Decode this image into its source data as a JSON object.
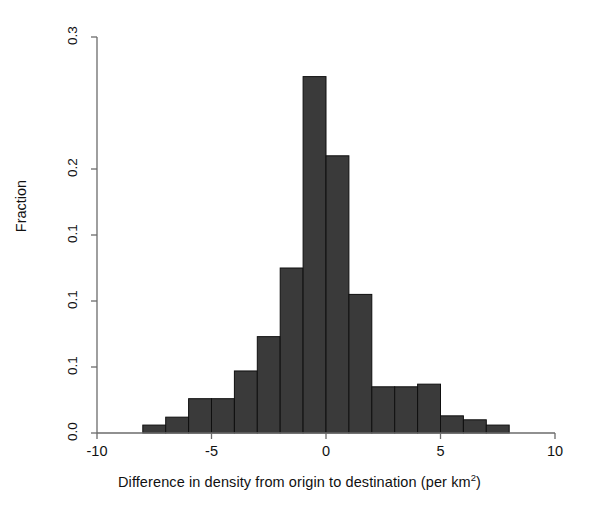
{
  "chart_data": {
    "type": "bar",
    "title": "",
    "subtitle": "",
    "xlabel": "Difference in density from origin to destination (per km2)",
    "xlabel_base": "Difference in density from origin to destination (per km",
    "xlabel_sup": "2",
    "xlabel_tail": ")",
    "ylabel": "Fraction",
    "xlim": [
      -10,
      10
    ],
    "ylim": [
      0.0,
      0.3
    ],
    "grid": false,
    "legend": null,
    "bar_color": "#3a3a3a",
    "axis_color": "#6b6b6b",
    "xticks": [
      -10,
      -5,
      0,
      5,
      10
    ],
    "xtick_labels": [
      "-10",
      "-5",
      "0",
      "5",
      "10"
    ],
    "yticks": [
      0.0,
      0.05,
      0.1,
      0.15,
      0.2,
      0.25,
      0.3
    ],
    "ytick_labels": [
      "0.0",
      "0.1",
      "0.1",
      "0.1",
      "0.2",
      "0.3"
    ],
    "ytick_values_plotted": [
      0.0,
      0.05,
      0.1,
      0.15,
      0.2,
      0.3
    ],
    "bin_width": 1.0,
    "categories": [
      -7.5,
      -6.5,
      -5.5,
      -4.5,
      -3.5,
      -2.5,
      -1.5,
      -0.5,
      0.5,
      1.5,
      2.5,
      3.5,
      4.5,
      5.5,
      6.5,
      7.5
    ],
    "bin_edges": [
      -8.0,
      -7.0,
      -6.0,
      -5.0,
      -4.0,
      -3.0,
      -2.0,
      -1.0,
      0.0,
      1.0,
      2.0,
      3.0,
      4.0,
      5.0,
      6.0,
      7.0,
      8.0
    ],
    "values": [
      0.006,
      0.012,
      0.026,
      0.026,
      0.047,
      0.073,
      0.125,
      0.27,
      0.21,
      0.105,
      0.035,
      0.035,
      0.037,
      0.013,
      0.01,
      0.006
    ],
    "bars": [
      {
        "bin_center": -7.5,
        "x0": -8.0,
        "x1": -7.0,
        "value": 0.006
      },
      {
        "bin_center": -6.5,
        "x0": -7.0,
        "x1": -6.0,
        "value": 0.012
      },
      {
        "bin_center": -5.5,
        "x0": -6.0,
        "x1": -5.0,
        "value": 0.026
      },
      {
        "bin_center": -4.5,
        "x0": -5.0,
        "x1": -4.0,
        "value": 0.026
      },
      {
        "bin_center": -3.5,
        "x0": -4.0,
        "x1": -3.0,
        "value": 0.047
      },
      {
        "bin_center": -2.5,
        "x0": -3.0,
        "x1": -2.0,
        "value": 0.073
      },
      {
        "bin_center": -1.5,
        "x0": -2.0,
        "x1": -1.0,
        "value": 0.125
      },
      {
        "bin_center": -0.5,
        "x0": -1.0,
        "x1": 0.0,
        "value": 0.27
      },
      {
        "bin_center": 0.5,
        "x0": 0.0,
        "x1": 1.0,
        "value": 0.21
      },
      {
        "bin_center": 1.5,
        "x0": 1.0,
        "x1": 2.0,
        "value": 0.105
      },
      {
        "bin_center": 2.5,
        "x0": 2.0,
        "x1": 3.0,
        "value": 0.035
      },
      {
        "bin_center": 3.5,
        "x0": 3.0,
        "x1": 4.0,
        "value": 0.035
      },
      {
        "bin_center": 4.5,
        "x0": 4.0,
        "x1": 5.0,
        "value": 0.037
      },
      {
        "bin_center": 5.5,
        "x0": 5.0,
        "x1": 6.0,
        "value": 0.013
      },
      {
        "bin_center": 6.5,
        "x0": 6.0,
        "x1": 7.0,
        "value": 0.01
      },
      {
        "bin_center": 7.5,
        "x0": 7.0,
        "x1": 8.0,
        "value": 0.006
      }
    ]
  },
  "geometry": {
    "plot_left": 97,
    "plot_right": 555,
    "baseline_y": 433,
    "y_top_px": 37,
    "y_top_value": 0.3,
    "tick_len": 6
  }
}
